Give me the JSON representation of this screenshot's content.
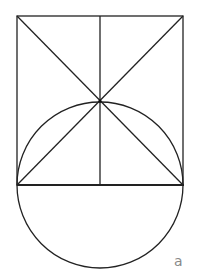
{
  "diagram": {
    "label": "a",
    "stroke_color": "#222222",
    "label_color": "#888888",
    "square": {
      "x": 17,
      "y": 16,
      "width": 166,
      "height": 169
    },
    "circle": {
      "cx": 100,
      "cy": 185,
      "r": 83
    },
    "intersection": {
      "x": 100,
      "y": 101
    }
  }
}
